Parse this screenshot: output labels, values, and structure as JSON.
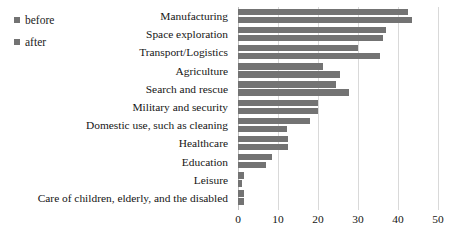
{
  "chart_data": {
    "type": "bar",
    "orientation": "horizontal",
    "title": "",
    "subtitle": "",
    "xlabel": "",
    "ylabel": "",
    "xlim": [
      0,
      50
    ],
    "xticks": [
      0,
      10,
      20,
      30,
      40,
      50
    ],
    "xtick_labels": [
      "0",
      "10",
      "20",
      "30",
      "40",
      "50"
    ],
    "grid": true,
    "grid_axis": "x",
    "legend_position": "top-left",
    "categories": [
      "Manufacturing",
      "Space exploration",
      "Transport/Logistics",
      "Agriculture",
      "Search and rescue",
      "Military and security",
      "Domestic use, such as cleaning",
      "Healthcare",
      "Education",
      "Leisure",
      "Care of children, elderly, and the disabled"
    ],
    "series": [
      {
        "name": "before",
        "color": "#737373",
        "values": [
          42.5,
          37.0,
          30.0,
          21.3,
          24.5,
          20.0,
          18.0,
          12.5,
          8.5,
          1.5,
          1.5
        ]
      },
      {
        "name": "after",
        "color": "#737373",
        "values": [
          43.5,
          36.2,
          35.5,
          25.5,
          27.8,
          20.0,
          12.3,
          12.5,
          7.0,
          1.0,
          1.5
        ]
      }
    ]
  },
  "legend": {
    "items": [
      {
        "label": "before",
        "color": "#737373",
        "marker": "square-marker"
      },
      {
        "label": "after",
        "color": "#737373",
        "marker": "square-marker"
      }
    ]
  },
  "axis": {
    "ticks": [
      "0",
      "10",
      "20",
      "30",
      "40",
      "50"
    ]
  }
}
